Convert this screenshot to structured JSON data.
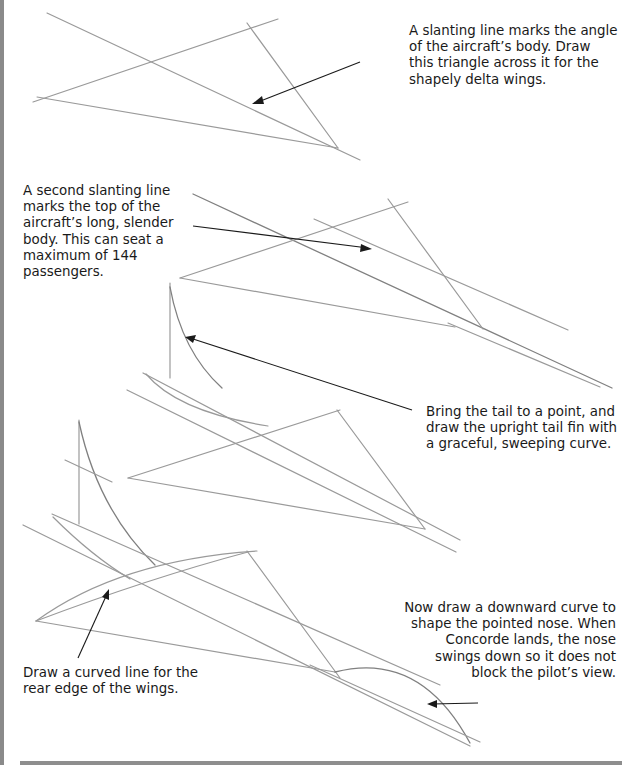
{
  "page": {
    "steps": [
      {
        "id": "step-1",
        "caption": "A slanting line marks the angle of the aircraft’s body. Draw this triangle across it for the shapely delta wings."
      },
      {
        "id": "step-2",
        "caption": "A second slanting line marks the top of the aircraft’s long, slender body. This can seat a maximum of 144 passengers."
      },
      {
        "id": "step-3",
        "caption": "Bring the tail to a point, and draw the upright tail fin with a graceful, sweeping curve."
      },
      {
        "id": "step-4",
        "caption": "Now draw a downward curve to shape the pointed nose. When Concorde lands, the nose swings down so it does not block the pilot’s view."
      },
      {
        "id": "step-5",
        "caption": "Draw a curved line for the rear edge of the wings."
      }
    ]
  },
  "colors": {
    "pencil": "#9a9a9a",
    "ink": "#1a1a1a",
    "edge": "#8a8a8a",
    "background": "#ffffff"
  }
}
